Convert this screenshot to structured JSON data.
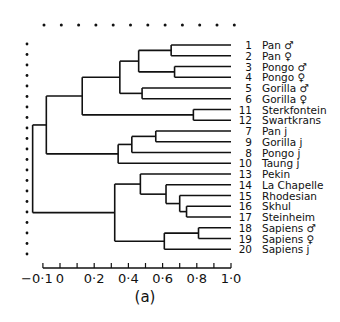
{
  "figure": {
    "caption": "(a)",
    "ink_color": "#111111",
    "background": "#ffffff"
  },
  "chart_data": {
    "type": "dendrogram",
    "title": "",
    "caption": "(a)",
    "xlabel": "",
    "xlim": [
      -0.1,
      1.0
    ],
    "x_ticks": [
      -0.1,
      0,
      0.1,
      0.2,
      0.3,
      0.4,
      0.5,
      0.6,
      0.7,
      0.8,
      0.9,
      1.0
    ],
    "x_tick_labels": [
      "-0·1",
      "0",
      "0·2",
      "0·4",
      "0·6",
      "0·8",
      "1·0"
    ],
    "x_tick_label_values": [
      -0.1,
      0,
      0.2,
      0.4,
      0.6,
      0.8,
      1.0
    ],
    "leaves": [
      {
        "id": "1",
        "label": "Pan ♂"
      },
      {
        "id": "2",
        "label": "Pan ♀"
      },
      {
        "id": "3",
        "label": "Pongo ♂"
      },
      {
        "id": "4",
        "label": "Pongo ♀"
      },
      {
        "id": "5",
        "label": "Gorilla ♂"
      },
      {
        "id": "6",
        "label": "Gorilla ♀"
      },
      {
        "id": "11",
        "label": "Sterkfontein"
      },
      {
        "id": "12",
        "label": "Swartkrans"
      },
      {
        "id": "7",
        "label": "Pan j"
      },
      {
        "id": "9",
        "label": "Gorilla j"
      },
      {
        "id": "8",
        "label": "Pongo j"
      },
      {
        "id": "10",
        "label": "Taung j"
      },
      {
        "id": "13",
        "label": "Pekin"
      },
      {
        "id": "14",
        "label": "La Chapelle"
      },
      {
        "id": "15",
        "label": "Rhodesian"
      },
      {
        "id": "16",
        "label": "Skhul"
      },
      {
        "id": "17",
        "label": "Steinheim"
      },
      {
        "id": "18",
        "label": "Sapiens ♂"
      },
      {
        "id": "19",
        "label": "Sapiens ♀"
      },
      {
        "id": "20",
        "label": "Sapiens j"
      }
    ],
    "merges": [
      {
        "node": "A",
        "children": [
          "1",
          "2"
        ],
        "height": 0.65
      },
      {
        "node": "B",
        "children": [
          "3",
          "4"
        ],
        "height": 0.67
      },
      {
        "node": "C",
        "children": [
          "A",
          "B"
        ],
        "height": 0.46
      },
      {
        "node": "D",
        "children": [
          "5",
          "6"
        ],
        "height": 0.48
      },
      {
        "node": "E",
        "children": [
          "C",
          "D"
        ],
        "height": 0.35
      },
      {
        "node": "F",
        "children": [
          "11",
          "12"
        ],
        "height": 0.78
      },
      {
        "node": "G",
        "children": [
          "E",
          "F"
        ],
        "height": 0.13
      },
      {
        "node": "H",
        "children": [
          "7",
          "9"
        ],
        "height": 0.56
      },
      {
        "node": "I",
        "children": [
          "H",
          "8"
        ],
        "height": 0.42
      },
      {
        "node": "J",
        "children": [
          "I",
          "10"
        ],
        "height": 0.34
      },
      {
        "node": "K",
        "children": [
          "G",
          "J"
        ],
        "height": -0.08
      },
      {
        "node": "L",
        "children": [
          "16",
          "17"
        ],
        "height": 0.74
      },
      {
        "node": "M",
        "children": [
          "15",
          "L"
        ],
        "height": 0.7
      },
      {
        "node": "N",
        "children": [
          "14",
          "M"
        ],
        "height": 0.62
      },
      {
        "node": "O",
        "children": [
          "13",
          "N"
        ],
        "height": 0.47
      },
      {
        "node": "P",
        "children": [
          "18",
          "19"
        ],
        "height": 0.81
      },
      {
        "node": "Q",
        "children": [
          "P",
          "20"
        ],
        "height": 0.61
      },
      {
        "node": "R",
        "children": [
          "O",
          "Q"
        ],
        "height": 0.32
      },
      {
        "node": "ROOT",
        "children": [
          "K",
          "R"
        ],
        "height": -0.16
      }
    ],
    "leaf_end_value": 1.0,
    "dotted_border": {
      "top": true,
      "left": true
    }
  }
}
